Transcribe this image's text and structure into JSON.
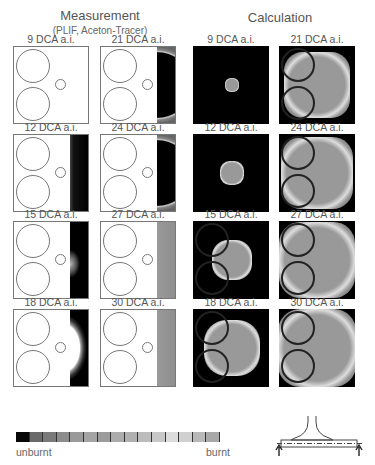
{
  "headers": {
    "measurement_title": "Measurement",
    "measurement_subtitle": "(PLIF, Aceton-Tracer)",
    "calculation_title": "Calculation"
  },
  "measurement_panels": [
    {
      "label": "9 DCA a.i.",
      "col": 0,
      "row": 0,
      "burn_strip": "none"
    },
    {
      "label": "21 DCA a.i.",
      "col": 1,
      "row": 0,
      "burn_strip": "gray-arc"
    },
    {
      "label": "12 DCA a.i.",
      "col": 0,
      "row": 1,
      "burn_strip": "dark"
    },
    {
      "label": "24 DCA a.i.",
      "col": 1,
      "row": 1,
      "burn_strip": "gray-arc"
    },
    {
      "label": "15 DCA a.i.",
      "col": 0,
      "row": 2,
      "burn_strip": "dark-bulge"
    },
    {
      "label": "27 DCA a.i.",
      "col": 1,
      "row": 2,
      "burn_strip": "gray"
    },
    {
      "label": "18 DCA a.i.",
      "col": 0,
      "row": 3,
      "burn_strip": "dark-arc"
    },
    {
      "label": "30 DCA a.i.",
      "col": 1,
      "row": 3,
      "burn_strip": "gray"
    }
  ],
  "calculation_panels": [
    {
      "label": "9 DCA a.i.",
      "col": 0,
      "row": 0,
      "flame_size": 14
    },
    {
      "label": "21 DCA a.i.",
      "col": 1,
      "row": 0,
      "flame_size": 66
    },
    {
      "label": "12 DCA a.i.",
      "col": 0,
      "row": 1,
      "flame_size": 24
    },
    {
      "label": "24 DCA a.i.",
      "col": 1,
      "row": 1,
      "flame_size": 72
    },
    {
      "label": "15 DCA a.i.",
      "col": 0,
      "row": 2,
      "flame_size": 40
    },
    {
      "label": "27 DCA a.i.",
      "col": 1,
      "row": 2,
      "flame_size": 76
    },
    {
      "label": "18 DCA a.i.",
      "col": 0,
      "row": 3,
      "flame_size": 56
    },
    {
      "label": "30 DCA a.i.",
      "col": 1,
      "row": 3,
      "flame_size": 78
    }
  ],
  "legend": {
    "left_label": "unburnt",
    "right_label": "burnt",
    "colors": [
      "#080808",
      "#6a6a6a",
      "#7a7a7a",
      "#8c8c8c",
      "#9a9a9a",
      "#a4a4a4",
      "#9c9c9c",
      "#acacac",
      "#b0b0b0",
      "#bcbcbc",
      "#c8c8c8",
      "#dcdcdc",
      "#d0d0d0",
      "#b8b8b8",
      "#a8a8a8"
    ]
  },
  "icons": {
    "engine_schematic": "valve-cylinder-schematic"
  }
}
